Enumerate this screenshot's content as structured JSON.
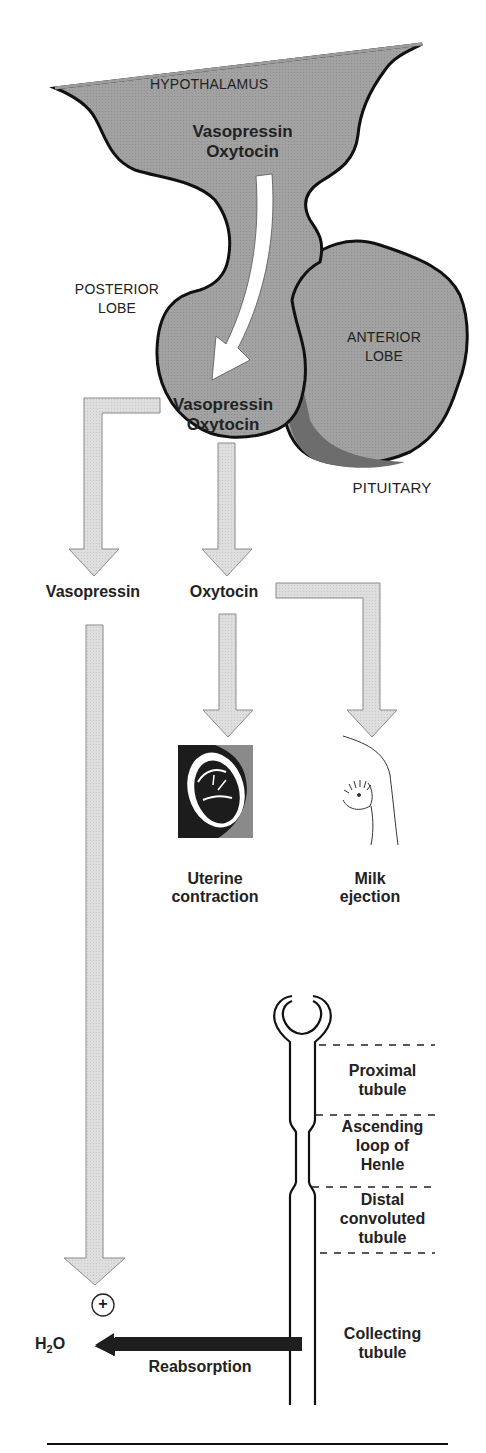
{
  "colors": {
    "gland_fill": "#9c9c9c",
    "gland_outline": "#111111",
    "anterior_shadow": "#6f6f6f",
    "flow_arrow_fill": "#dcdcdc",
    "flow_arrow_stroke": "#8a8a8a",
    "reabsorption_arrow": "#1e1e1e",
    "text": "#222222"
  },
  "pituitary": {
    "hypothalamus_label": "HYPOTHALAMUS",
    "hypothalamus_hormone_1": "Vasopressin",
    "hypothalamus_hormone_2": "Oxytocin",
    "posterior_lobe_label_1": "POSTERIOR",
    "posterior_lobe_label_2": "LOBE",
    "anterior_lobe_label_1": "ANTERIOR",
    "anterior_lobe_label_2": "LOBE",
    "posterior_hormone_1": "Vasopressin",
    "posterior_hormone_2": "Oxytocin",
    "pituitary_label": "PITUITARY"
  },
  "hormones": {
    "vasopressin": "Vasopressin",
    "oxytocin": "Oxytocin"
  },
  "targets": {
    "uterine_1": "Uterine",
    "uterine_2": "contraction",
    "milk_1": "Milk",
    "milk_2": "ejection"
  },
  "nephron": {
    "segments": [
      {
        "line1": "Proximal",
        "line2": "tubule"
      },
      {
        "line1": "Ascending",
        "line2": "loop of",
        "line3": "Henle"
      },
      {
        "line1": "Distal",
        "line2": "convoluted",
        "line3": "tubule"
      },
      {
        "line1": "Collecting",
        "line2": "tubule"
      }
    ]
  },
  "effect": {
    "plus_symbol": "+",
    "water_H": "H",
    "water_sub": "2",
    "water_O": "O",
    "reabsorption_label": "Reabsorption"
  }
}
